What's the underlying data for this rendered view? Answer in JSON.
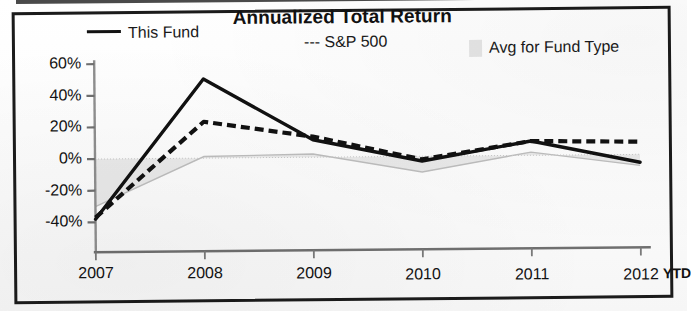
{
  "chart_data": {
    "type": "line",
    "title": "Annualized Total Return",
    "xlabel": "",
    "ylabel": "",
    "ylim": [
      -50,
      60
    ],
    "yticks": [
      -40,
      -20,
      0,
      20,
      40,
      60
    ],
    "ytick_labels": [
      "-40%",
      "-20%",
      "0%",
      "20%",
      "40%",
      "60%"
    ],
    "categories": [
      "2007",
      "2008",
      "2009",
      "2010",
      "2011",
      "2012"
    ],
    "x_suffix_label": "YTD",
    "grid": false,
    "legend_position": "top",
    "series": [
      {
        "name": "This Fund",
        "style": "solid",
        "color": "#111111",
        "values": [
          -38,
          50,
          11,
          -3,
          9,
          -5
        ]
      },
      {
        "name": "--- S&P 500",
        "style": "dashed",
        "color": "#111111",
        "values": [
          -37,
          23,
          13,
          -2,
          9,
          8
        ]
      },
      {
        "name": "Avg for Fund Type",
        "style": "shaded-band",
        "color": "#d9d9d9",
        "values": [
          -30,
          1,
          2,
          -10,
          2,
          -7
        ]
      }
    ]
  },
  "legend": {
    "items": [
      {
        "label": "This Fund",
        "marker": "solid-line-swatch"
      },
      {
        "label": "--- S&P 500",
        "marker": "dashed-text-marker"
      },
      {
        "label": "Avg for Fund Type",
        "marker": "gray-box-swatch"
      }
    ]
  },
  "axes": {
    "y_tick_labels": [
      "60%",
      "40%",
      "20%",
      "0%",
      "-20%",
      "-40%"
    ],
    "x_tick_labels": [
      "2007",
      "2008",
      "2009",
      "2010",
      "2011",
      "2012"
    ],
    "x_extra_label": "YTD"
  },
  "colors": {
    "frame": "#1b1b1b",
    "line": "#111111",
    "band_fill": "#dcdcdc",
    "band_stroke": "#bdbdbd",
    "paper": "#fdfdfd"
  }
}
